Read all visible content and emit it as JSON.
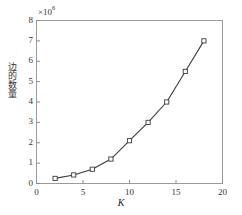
{
  "chart_data": {
    "type": "line",
    "title": "",
    "subtitle": "",
    "xlabel": "K",
    "ylabel": "边的数量",
    "y_exponent_label": "×10",
    "y_exponent_value": "6",
    "y_scale_factor": 1000000,
    "x": [
      2,
      4,
      6,
      8,
      10,
      12,
      14,
      16,
      18
    ],
    "values": [
      0.25,
      0.42,
      0.7,
      1.2,
      2.1,
      3.0,
      4.0,
      5.5,
      7.0
    ],
    "series": [
      {
        "name": "边的数量",
        "values": [
          0.25,
          0.42,
          0.7,
          1.2,
          2.1,
          3.0,
          4.0,
          5.5,
          7.0
        ]
      }
    ],
    "xlim": [
      0,
      20
    ],
    "ylim": [
      0,
      8
    ],
    "xticks": [
      0,
      5,
      10,
      15,
      20
    ],
    "xtick_labels": [
      "0",
      "5",
      "10",
      "15",
      "20"
    ],
    "yticks": [
      0,
      1,
      2,
      3,
      4,
      5,
      6,
      7,
      8
    ],
    "ytick_labels": [
      "0",
      "1",
      "2",
      "3",
      "4",
      "5",
      "6",
      "7",
      "8"
    ],
    "grid": false,
    "legend": false,
    "legend_position": "none",
    "marker": "square-open",
    "line_color": "#3a3a3a",
    "marker_edge_color": "#3a3a3a",
    "marker_face_color": "#ffffff",
    "axis_color": "#8a8a8a",
    "background_color": "#ffffff"
  }
}
